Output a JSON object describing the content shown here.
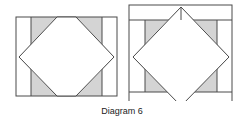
{
  "caption": "Diagram 6",
  "colors": {
    "stroke": "#4a4a4a",
    "fill_shaded": "#d4d4d4",
    "background": "#ffffff"
  },
  "diagrams": [
    {
      "name": "left-block",
      "description": "square-in-a-square block with side strips"
    },
    {
      "name": "right-block",
      "description": "square-in-a-square block with side strips and top/bottom borders"
    }
  ]
}
